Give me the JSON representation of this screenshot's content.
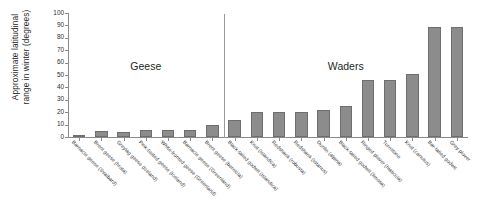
{
  "chart_data": {
    "type": "bar",
    "title": "",
    "xlabel": "",
    "ylabel": "Approximate latitudinal\nrange in winter (degrees)",
    "ylim": [
      0,
      100
    ],
    "yticks": [
      0,
      10,
      20,
      30,
      40,
      50,
      60,
      70,
      80,
      90,
      100
    ],
    "grid": false,
    "legend": "none",
    "bar_color": "#8c8c8c",
    "bar_edge_color": "#6e6e6e",
    "categories": [
      "Barnacle geese (Svalbard)",
      "Brent geese (hrota)",
      "Greylag geese (Iceland)",
      "Pink-footed geese (Iceland)",
      "White-fronted geese (Greenland)",
      "Barnacle geese (Greenland)",
      "Brent geese (bernicla)",
      "Black-tailed godwit (islandica)",
      "Knot (islandica)",
      "Redshank (robusta)",
      "Redshank (totanus)",
      "Dunlin (alpina)",
      "Black-tailed godwit (limosa)",
      "Ringed plover (hiaticula)",
      "Turnstone",
      "Knot (canutus)",
      "Bar-tailed godwit",
      "Grey plover"
    ],
    "values": [
      1,
      4.5,
      4,
      5.5,
      6,
      6,
      9.5,
      13.5,
      20,
      20,
      20,
      22,
      25,
      46,
      46,
      51,
      89,
      89
    ],
    "group_annotations": [
      {
        "label": "Geese",
        "start_index": 0,
        "end_index": 6
      },
      {
        "label": "Waders",
        "start_index": 7,
        "end_index": 17
      }
    ],
    "divider_after_index": 6
  },
  "axis": {
    "y_title_line1": "Approximate latitudinal",
    "y_title_line2": "range in winter (degrees)"
  }
}
